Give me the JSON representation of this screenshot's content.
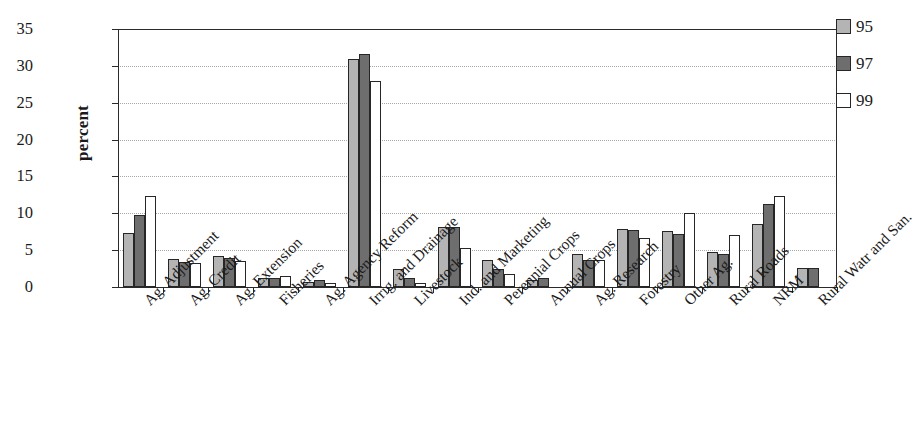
{
  "chart_data": {
    "type": "bar",
    "title": "",
    "subtitle": "",
    "xlabel": "",
    "ylabel": "percent",
    "ylim": [
      0,
      35
    ],
    "ytick_labels": [
      "0",
      "5",
      "10",
      "15",
      "20",
      "25",
      "30",
      "35"
    ],
    "ytick_values": [
      0,
      5,
      10,
      15,
      20,
      25,
      30,
      35
    ],
    "grid": true,
    "grid_axis": "y",
    "legend_position": "top-right",
    "categories": [
      "Ag. Adjustment",
      "Ag. Credit",
      "Ag. Extension",
      "Fisheries",
      "Ag. Agency Reform",
      "Irrig. and Drainage",
      "Livestock",
      "Ind. and Marketing",
      "Perennial Crops",
      "Annual Crops",
      "Ag. Research",
      "Forestry",
      "Other Ag.",
      "Rural Roads",
      "NRM",
      "Rural Watr and San."
    ],
    "series": [
      {
        "name": "95",
        "color": "#b4b4b4",
        "values": [
          7.3,
          3.8,
          4.2,
          1.2,
          0.7,
          30.9,
          2.4,
          8.1,
          3.6,
          1.0,
          4.5,
          7.9,
          7.6,
          4.8,
          8.5,
          2.6
        ]
      },
      {
        "name": "97",
        "color": "#6e6e6e",
        "values": [
          9.8,
          3.4,
          4.0,
          1.2,
          1.0,
          31.6,
          1.2,
          8.1,
          2.5,
          1.2,
          3.6,
          7.7,
          7.2,
          4.5,
          11.2,
          2.6
        ]
      },
      {
        "name": "99",
        "color": "#ffffff",
        "values": [
          12.4,
          3.3,
          3.5,
          1.5,
          0.6,
          27.9,
          0.6,
          5.3,
          1.8,
          0.0,
          3.6,
          6.6,
          10.0,
          7.0,
          12.4,
          0.0
        ]
      }
    ]
  }
}
